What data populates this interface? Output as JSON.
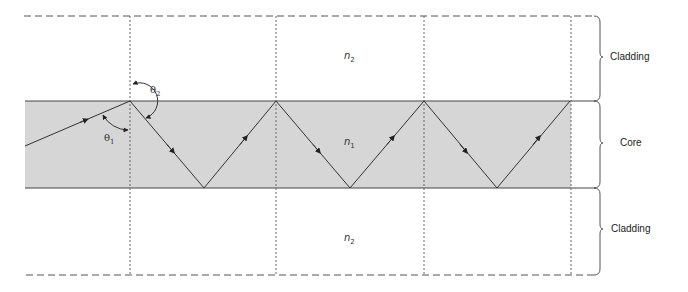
{
  "diagram": {
    "regions": [
      {
        "name": "Cladding",
        "index_symbol": "n",
        "index_sub": "2",
        "position": "top"
      },
      {
        "name": "Core",
        "index_symbol": "n",
        "index_sub": "1",
        "position": "middle"
      },
      {
        "name": "Cladding",
        "index_symbol": "n",
        "index_sub": "2",
        "position": "bottom"
      }
    ],
    "angles": [
      {
        "symbol": "θ",
        "sub": "1",
        "meaning": "angle of incidence in core"
      },
      {
        "symbol": "θ",
        "sub": "2",
        "meaning": "angle in cladding"
      }
    ],
    "colors": {
      "core_fill": "#d6d6d6",
      "line": "#444444",
      "dashed": "#555555"
    },
    "geometry": {
      "core_top_y": 101,
      "core_bottom_y": 188,
      "top_bound_y": 16,
      "bottom_bound_y": 275,
      "left_x": 25,
      "right_x": 596,
      "verticals_x": [
        130,
        276,
        424,
        571
      ],
      "ray_points": [
        [
          25,
          146
        ],
        [
          130,
          101
        ],
        [
          204,
          188
        ],
        [
          276,
          101
        ],
        [
          350,
          188
        ],
        [
          424,
          101
        ],
        [
          497,
          188
        ],
        [
          570,
          101
        ]
      ]
    }
  },
  "labels": {
    "cladding_top": "Cladding",
    "core": "Core",
    "cladding_bottom": "Cladding",
    "n_sym": "n",
    "n2_sub": "2",
    "n1_sub": "1",
    "theta": "θ",
    "theta1_sub": "1",
    "theta2_sub": "2"
  }
}
